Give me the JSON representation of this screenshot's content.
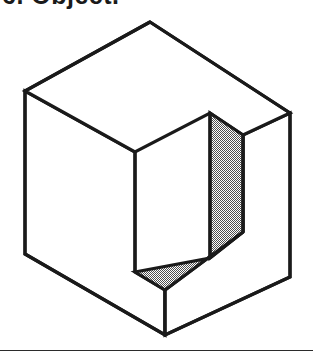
{
  "page": {
    "width": 313,
    "height": 361,
    "background": "#ffffff"
  },
  "caption": {
    "text": "6. Object.",
    "note": "clipped at top edge of screenshot; only bottoms of glyph strokes are visible",
    "color": "#1a1a1a"
  },
  "figure": {
    "name": "isometric-cube-with-notch",
    "stroke_color": "#1a1a1a",
    "stroke_width": 3.2,
    "face_fill": "#ffffff",
    "hatch_color": "#4a4a4a",
    "hatch_style": "50-percent-checkerboard-dither",
    "vertices": {
      "top_apex": [
        150,
        22
      ],
      "left_top": [
        25,
        91
      ],
      "right_top": [
        290,
        113
      ],
      "front_top": [
        135,
        152
      ],
      "left_bottom": [
        25,
        254
      ],
      "right_bottom": [
        290,
        277
      ],
      "bottom_apex": [
        165,
        335
      ],
      "front_bottom": [
        135,
        272
      ],
      "notch_top_inner": [
        210,
        113
      ],
      "notch_top_right": [
        243,
        135
      ],
      "notch_floor_front": [
        165,
        290
      ],
      "notch_floor_right": [
        243,
        232
      ]
    },
    "outline_path": "M150,22 L25,91 L25,254 L165,335 L290,277 L290,113 Z",
    "top_face_path": "M150,22 L25,91 L135,152 L210,113 L243,135 L290,113 Z",
    "left_face_path": "M25,91 L25,254 L165,335 L165,290 L135,272 L135,152 Z",
    "notch_wall_path": "M210,113 L210,258 L243,232 L243,135 Z",
    "notch_floor_path": "M135,272 L165,290 L243,232 L210,258 Z",
    "right_face_path": "M243,135 L243,232 L165,290 L165,335 L290,277 L290,113 Z"
  },
  "footer": {
    "rule_name": "bottom-divider-rule",
    "y": 350,
    "color": "#2b2b2b",
    "thickness": 1
  }
}
